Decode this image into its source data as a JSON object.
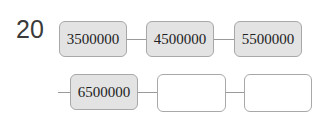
{
  "problem": {
    "number": "20",
    "row1": [
      "3500000",
      "4500000",
      "5500000"
    ],
    "row2": [
      "6500000",
      "",
      ""
    ]
  },
  "colors": {
    "filled_box": "#e3e3e3",
    "border": "#a8a8a8",
    "text": "#222222"
  }
}
